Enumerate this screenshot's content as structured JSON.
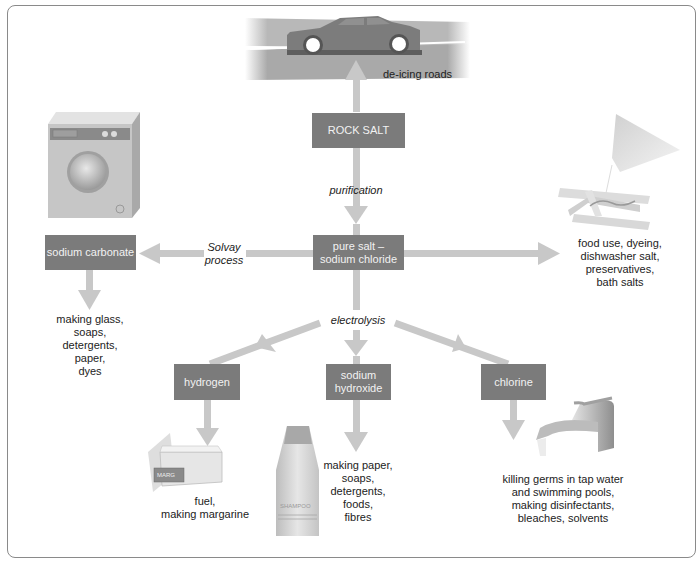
{
  "diagram": {
    "nodes": {
      "rock_salt": "ROCK SALT",
      "pure_salt_line1": "pure salt –",
      "pure_salt_line2": "sodium chloride",
      "sodium_carbonate": "sodium carbonate",
      "hydrogen": "hydrogen",
      "sodium_hydroxide_line1": "sodium",
      "sodium_hydroxide_line2": "hydroxide",
      "chlorine": "chlorine"
    },
    "processes": {
      "purification": "purification",
      "solvay_line1": "Solvay",
      "solvay_line2": "process",
      "electrolysis": "electrolysis"
    },
    "uses": {
      "rock_salt": [
        "de-icing roads"
      ],
      "pure_salt": [
        "food use, dyeing,",
        "dishwasher salt,",
        "preservatives,",
        "bath salts"
      ],
      "sodium_carbonate": [
        "making glass,",
        "soaps,",
        "detergents,",
        "paper,",
        "dyes"
      ],
      "hydrogen": [
        "fuel,",
        "making margarine"
      ],
      "sodium_hydroxide": [
        "making paper,",
        "soaps,",
        "detergents,",
        "foods,",
        "fibres"
      ],
      "chlorine": [
        "killing germs in tap water",
        "and swimming pools,",
        "making disinfectants,",
        "bleaches, solvents"
      ]
    },
    "illustrations": {
      "margarine_label": "MARG",
      "shampoo_label": "SHAMPOO"
    },
    "colors": {
      "box": "#7b7b7b",
      "arrow": "#c8c8c8",
      "frame": "#8a8a8a",
      "text": "#222222"
    }
  }
}
